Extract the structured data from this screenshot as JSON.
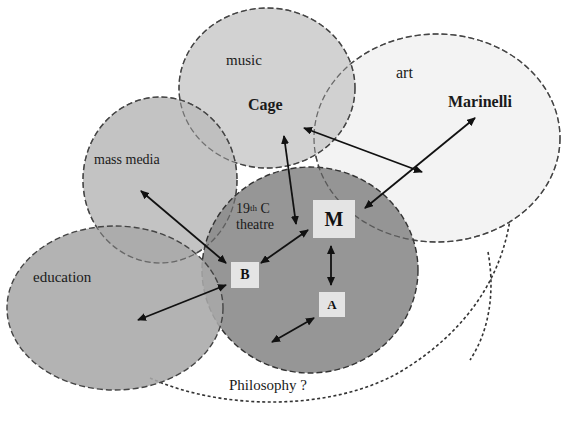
{
  "diagram": {
    "title": "",
    "domains": [
      {
        "id": "music",
        "label": "music",
        "fill": "#cfcfcf"
      },
      {
        "id": "art",
        "label": "art",
        "fill": "#f2f2f2"
      },
      {
        "id": "mass_media",
        "label": "mass media",
        "fill": "#bdbdbd"
      },
      {
        "id": "theatre",
        "label_line1": "19",
        "label_sup": "th",
        "label_line1_rest": " C",
        "label_line2": "theatre",
        "fill": "#8f8f8f"
      },
      {
        "id": "education",
        "label": "education",
        "fill": "#a8a8a8"
      },
      {
        "id": "philosophy",
        "label": "Philosophy ?",
        "fill": "none"
      }
    ],
    "people": {
      "cage": "Cage",
      "marinelli": "Marinelli"
    },
    "nodes": {
      "m": "M",
      "a": "A",
      "b": "B"
    },
    "connections": [
      {
        "from": "Cage",
        "to": "art (between Cage and Marinelli)",
        "type": "double-arrow"
      },
      {
        "from": "Marinelli",
        "to": "M",
        "type": "double-arrow"
      },
      {
        "from": "Cage",
        "to": "19th C theatre",
        "type": "double-arrow"
      },
      {
        "from": "M",
        "to": "B",
        "type": "double-arrow"
      },
      {
        "from": "M",
        "to": "A",
        "type": "double-arrow"
      },
      {
        "from": "mass media",
        "to": "B",
        "type": "double-arrow"
      },
      {
        "from": "education",
        "to": "B",
        "type": "double-arrow"
      },
      {
        "from": "A",
        "to": "theatre edge",
        "type": "double-arrow"
      }
    ]
  }
}
